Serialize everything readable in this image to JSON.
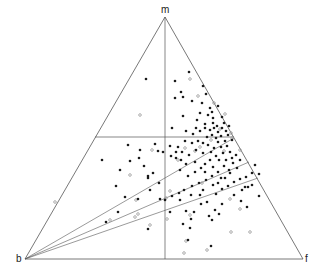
{
  "diagram": {
    "type": "ternary-scatter",
    "vertices": {
      "top": "m",
      "left": "b",
      "right": "f"
    },
    "colors": {
      "line": "#555555",
      "filled": "#1a1a1a",
      "open": "#9a9a9a"
    },
    "points_filled": [
      [
        146,
        79
      ],
      [
        189,
        72
      ],
      [
        175,
        81
      ],
      [
        181,
        92
      ],
      [
        183,
        97
      ],
      [
        203,
        86
      ],
      [
        206,
        94
      ],
      [
        192,
        101
      ],
      [
        175,
        98
      ],
      [
        202,
        103
      ],
      [
        210,
        108
      ],
      [
        212,
        112
      ],
      [
        218,
        106
      ],
      [
        208,
        115
      ],
      [
        200,
        113
      ],
      [
        213,
        118
      ],
      [
        222,
        117
      ],
      [
        213,
        123
      ],
      [
        217,
        126
      ],
      [
        205,
        124
      ],
      [
        197,
        120
      ],
      [
        183,
        116
      ],
      [
        172,
        128
      ],
      [
        186,
        131
      ],
      [
        193,
        134
      ],
      [
        196,
        128
      ],
      [
        200,
        131
      ],
      [
        205,
        128
      ],
      [
        210,
        130
      ],
      [
        214,
        128
      ],
      [
        218,
        132
      ],
      [
        222,
        128
      ],
      [
        226,
        131
      ],
      [
        224,
        123
      ],
      [
        229,
        126
      ],
      [
        228,
        135
      ],
      [
        221,
        136
      ],
      [
        216,
        138
      ],
      [
        212,
        135
      ],
      [
        207,
        137
      ],
      [
        218,
        142
      ],
      [
        225,
        141
      ],
      [
        232,
        140
      ],
      [
        227,
        146
      ],
      [
        221,
        147
      ],
      [
        214,
        148
      ],
      [
        208,
        145
      ],
      [
        203,
        143
      ],
      [
        198,
        141
      ],
      [
        192,
        143
      ],
      [
        185,
        141
      ],
      [
        178,
        147
      ],
      [
        170,
        146
      ],
      [
        163,
        152
      ],
      [
        155,
        144
      ],
      [
        158,
        151
      ],
      [
        171,
        156
      ],
      [
        176,
        152
      ],
      [
        181,
        160
      ],
      [
        186,
        164
      ],
      [
        180,
        170
      ],
      [
        188,
        176
      ],
      [
        195,
        172
      ],
      [
        201,
        168
      ],
      [
        205,
        164
      ],
      [
        210,
        160
      ],
      [
        216,
        156
      ],
      [
        223,
        153
      ],
      [
        230,
        152
      ],
      [
        236,
        155
      ],
      [
        240,
        160
      ],
      [
        233,
        163
      ],
      [
        229,
        170
      ],
      [
        224,
        166
      ],
      [
        218,
        172
      ],
      [
        212,
        176
      ],
      [
        206,
        180
      ],
      [
        199,
        183
      ],
      [
        192,
        186
      ],
      [
        184,
        190
      ],
      [
        179,
        193
      ],
      [
        172,
        196
      ],
      [
        160,
        199
      ],
      [
        150,
        190
      ],
      [
        139,
        158
      ],
      [
        144,
        166
      ],
      [
        125,
        197
      ],
      [
        138,
        199
      ],
      [
        116,
        186
      ],
      [
        130,
        161
      ],
      [
        118,
        212
      ],
      [
        106,
        222
      ],
      [
        102,
        160
      ],
      [
        148,
        229
      ],
      [
        190,
        228
      ],
      [
        183,
        224
      ],
      [
        194,
        212
      ],
      [
        186,
        211
      ],
      [
        201,
        204
      ],
      [
        207,
        202
      ],
      [
        216,
        194
      ],
      [
        222,
        189
      ],
      [
        228,
        186
      ],
      [
        234,
        182
      ],
      [
        240,
        179
      ],
      [
        246,
        177
      ],
      [
        252,
        173
      ],
      [
        248,
        187
      ],
      [
        259,
        174
      ],
      [
        259,
        196
      ],
      [
        247,
        207
      ],
      [
        241,
        201
      ],
      [
        234,
        195
      ],
      [
        222,
        204
      ],
      [
        219,
        214
      ],
      [
        212,
        220
      ],
      [
        209,
        216
      ],
      [
        191,
        219
      ],
      [
        188,
        240
      ],
      [
        211,
        246
      ],
      [
        215,
        210
      ],
      [
        230,
        173
      ],
      [
        221,
        178
      ],
      [
        213,
        185
      ],
      [
        245,
        187
      ],
      [
        252,
        185
      ],
      [
        200,
        195
      ],
      [
        170,
        212
      ],
      [
        165,
        200
      ],
      [
        159,
        183
      ],
      [
        153,
        173
      ],
      [
        148,
        176
      ],
      [
        140,
        150
      ],
      [
        128,
        145
      ],
      [
        120,
        170
      ],
      [
        148,
        178
      ],
      [
        242,
        190
      ],
      [
        255,
        165
      ],
      [
        237,
        168
      ],
      [
        232,
        158
      ],
      [
        226,
        160
      ],
      [
        219,
        160
      ],
      [
        211,
        152
      ],
      [
        203,
        153
      ],
      [
        196,
        150
      ],
      [
        189,
        155
      ],
      [
        182,
        152
      ],
      [
        176,
        158
      ],
      [
        195,
        162
      ],
      [
        213,
        167
      ],
      [
        205,
        172
      ],
      [
        225,
        178
      ],
      [
        218,
        183
      ],
      [
        203,
        190
      ],
      [
        180,
        200
      ],
      [
        191,
        195
      ]
    ],
    "points_open": [
      [
        140,
        115
      ],
      [
        190,
        79
      ],
      [
        198,
        96
      ],
      [
        214,
        103
      ],
      [
        225,
        114
      ],
      [
        220,
        129
      ],
      [
        231,
        133
      ],
      [
        211,
        140
      ],
      [
        224,
        151
      ],
      [
        200,
        147
      ],
      [
        178,
        160
      ],
      [
        152,
        150
      ],
      [
        130,
        175
      ],
      [
        136,
        200
      ],
      [
        138,
        214
      ],
      [
        150,
        225
      ],
      [
        167,
        219
      ],
      [
        170,
        191
      ],
      [
        184,
        253
      ],
      [
        207,
        250
      ],
      [
        186,
        241
      ],
      [
        231,
        232
      ],
      [
        250,
        232
      ],
      [
        240,
        209
      ],
      [
        230,
        199
      ],
      [
        202,
        183
      ],
      [
        195,
        151
      ],
      [
        185,
        148
      ],
      [
        166,
        198
      ],
      [
        135,
        217
      ],
      [
        110,
        220
      ],
      [
        55,
        202
      ],
      [
        232,
        138
      ],
      [
        190,
        215
      ],
      [
        240,
        150
      ]
    ],
    "fan_lines_from_b": [
      [
        234,
        138
      ],
      [
        249,
        162
      ],
      [
        258,
        178
      ]
    ],
    "horizontal_line": {
      "y": 137,
      "x1": 95,
      "x2": 234
    },
    "vertical_line": {
      "x": 165
    }
  }
}
